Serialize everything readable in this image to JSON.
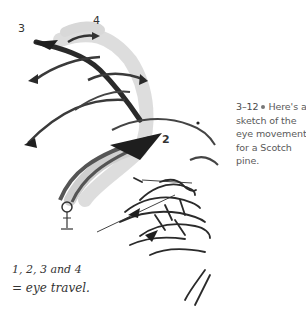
{
  "figure": {
    "labels": {
      "point_1": "",
      "point_2": "2",
      "point_3": "3",
      "point_4": "4"
    },
    "handwritten_note": {
      "line1": "1, 2, 3 and 4",
      "line2": "= eye travel."
    }
  },
  "caption": {
    "number": "3–12",
    "text": "Here's a sketch of the eye movement for a Scotch pine."
  },
  "colors": {
    "ink": "#2a2a2a",
    "shade": "#c8c8c8",
    "caption_text": "#5a5a5a"
  }
}
